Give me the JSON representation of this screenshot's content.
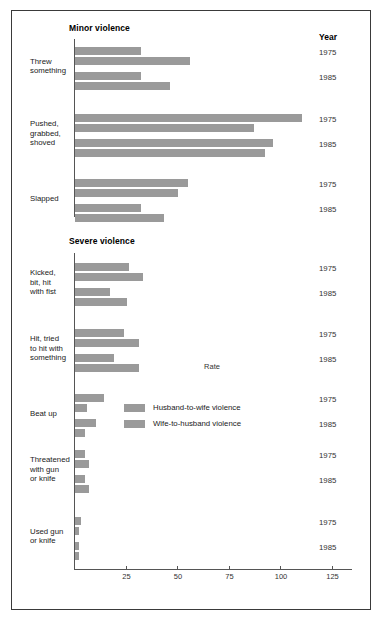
{
  "figure": {
    "year_header": "Year",
    "sections": [
      {
        "id": "minor",
        "title": "Minor violence"
      },
      {
        "id": "severe",
        "title": "Severe violence"
      }
    ]
  },
  "legend": {
    "position": "inside-middle-left",
    "entries": [
      {
        "label": "Husband-to-wife violence",
        "color": "#9a9a9a"
      },
      {
        "label": "Wife-to-husband violence",
        "color": "#9a9a9a"
      }
    ]
  },
  "years": [
    "1975",
    "1985"
  ],
  "chart_data": {
    "type": "bar",
    "orientation": "horizontal",
    "title": "",
    "xlabel": "Rate",
    "ylabel": "",
    "xlim": [
      0,
      135
    ],
    "xticks": [
      0,
      25,
      50,
      75,
      100,
      125
    ],
    "xtick_labels": [
      "",
      "25",
      "50",
      "75",
      "100",
      "125"
    ],
    "grid": false,
    "legend_position": "inside-middle-left",
    "bar_color": "#9a9a9a",
    "groups": [
      {
        "section": "Minor violence",
        "categories": [
          {
            "label": "Threw\nsomething",
            "label_lines": [
              "Threw",
              "something"
            ],
            "years": [
              {
                "year": "1975",
                "husband_to_wife": 32,
                "wife_to_husband": 56
              },
              {
                "year": "1985",
                "husband_to_wife": 32,
                "wife_to_husband": 46
              }
            ]
          },
          {
            "label": "Pushed,\ngrabbed,\nshoved",
            "label_lines": [
              "Pushed,",
              "grabbed,",
              "shoved"
            ],
            "years": [
              {
                "year": "1975",
                "husband_to_wife": 110,
                "wife_to_husband": 87
              },
              {
                "year": "1985",
                "husband_to_wife": 96,
                "wife_to_husband": 92
              }
            ]
          },
          {
            "label": "Slapped",
            "label_lines": [
              "Slapped"
            ],
            "years": [
              {
                "year": "1975",
                "husband_to_wife": 55,
                "wife_to_husband": 50
              },
              {
                "year": "1985",
                "husband_to_wife": 32,
                "wife_to_husband": 43
              }
            ]
          }
        ]
      },
      {
        "section": "Severe violence",
        "categories": [
          {
            "label": "Kicked,\nbit, hit\nwith fist",
            "label_lines": [
              "Kicked,",
              "bit, hit",
              "with fist"
            ],
            "years": [
              {
                "year": "1975",
                "husband_to_wife": 26,
                "wife_to_husband": 33
              },
              {
                "year": "1985",
                "husband_to_wife": 17,
                "wife_to_husband": 25
              }
            ]
          },
          {
            "label": "Hit, tried\nto hit with\nsomething",
            "label_lines": [
              "Hit, tried",
              "to hit with",
              "something"
            ],
            "years": [
              {
                "year": "1975",
                "husband_to_wife": 24,
                "wife_to_husband": 31
              },
              {
                "year": "1985",
                "husband_to_wife": 19,
                "wife_to_husband": 31
              }
            ]
          },
          {
            "label": "Beat up",
            "label_lines": [
              "Beat up"
            ],
            "years": [
              {
                "year": "1975",
                "husband_to_wife": 14,
                "wife_to_husband": 6
              },
              {
                "year": "1985",
                "husband_to_wife": 10,
                "wife_to_husband": 5
              }
            ]
          },
          {
            "label": "Threatened\nwith gun\nor knife",
            "label_lines": [
              "Threatened",
              "with gun",
              "or knife"
            ],
            "years": [
              {
                "year": "1975",
                "husband_to_wife": 5,
                "wife_to_husband": 7
              },
              {
                "year": "1985",
                "husband_to_wife": 5,
                "wife_to_husband": 7
              }
            ]
          },
          {
            "label": "Used gun\nor knife",
            "label_lines": [
              "Used gun",
              "or knife"
            ],
            "years": [
              {
                "year": "1975",
                "husband_to_wife": 3,
                "wife_to_husband": 2
              },
              {
                "year": "1985",
                "husband_to_wife": 2,
                "wife_to_husband": 2
              }
            ]
          }
        ]
      }
    ]
  }
}
